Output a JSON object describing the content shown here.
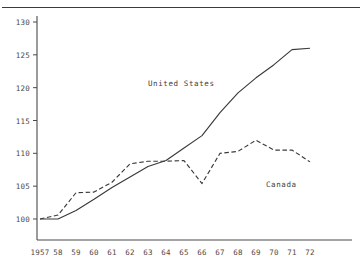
{
  "chart_data": {
    "type": "line",
    "title": "",
    "subtitle": "",
    "xlabel": "",
    "ylabel": "",
    "x": [
      1957,
      1958,
      1959,
      1960,
      1961,
      1962,
      1963,
      1964,
      1965,
      1966,
      1967,
      1968,
      1969,
      1970,
      1971,
      1972
    ],
    "xtick_labels": [
      "1957",
      "58",
      "59",
      "60",
      "61",
      "62",
      "63",
      "64",
      "65",
      "66",
      "67",
      "68",
      "69",
      "70",
      "71",
      "72"
    ],
    "ytick_labels": [
      "100",
      "105",
      "110",
      "115",
      "120",
      "125",
      "130"
    ],
    "yticks": [
      100,
      105,
      110,
      115,
      120,
      125,
      130
    ],
    "ylim": [
      97.5,
      130
    ],
    "xlim": [
      1957,
      1973.2
    ],
    "grid": false,
    "legend_position": "inline-annotation",
    "series": [
      {
        "name": "United States",
        "label": "United States",
        "style": "solid",
        "color": "#3a3a3a",
        "values": [
          100.0,
          100.0,
          101.3,
          103.0,
          104.8,
          106.4,
          108.0,
          108.9,
          110.8,
          112.7,
          116.2,
          119.2,
          121.5,
          123.5,
          125.8,
          126.0
        ],
        "annotation": {
          "text": "United States",
          "x_px": 148,
          "y_px": 79
        }
      },
      {
        "name": "Canada",
        "label": "Canada",
        "style": "dashed",
        "color": "#3a3a3a",
        "values": [
          100.0,
          100.6,
          104.0,
          104.1,
          105.6,
          108.4,
          108.8,
          108.8,
          108.9,
          105.4,
          110.0,
          110.3,
          112.0,
          110.5,
          110.5,
          108.7
        ],
        "annotation": {
          "text": "Canada",
          "x_px": 266,
          "y_px": 180
        }
      }
    ]
  },
  "axis": {
    "y_axis_label_count": 7,
    "x_axis_label_count": 16
  }
}
